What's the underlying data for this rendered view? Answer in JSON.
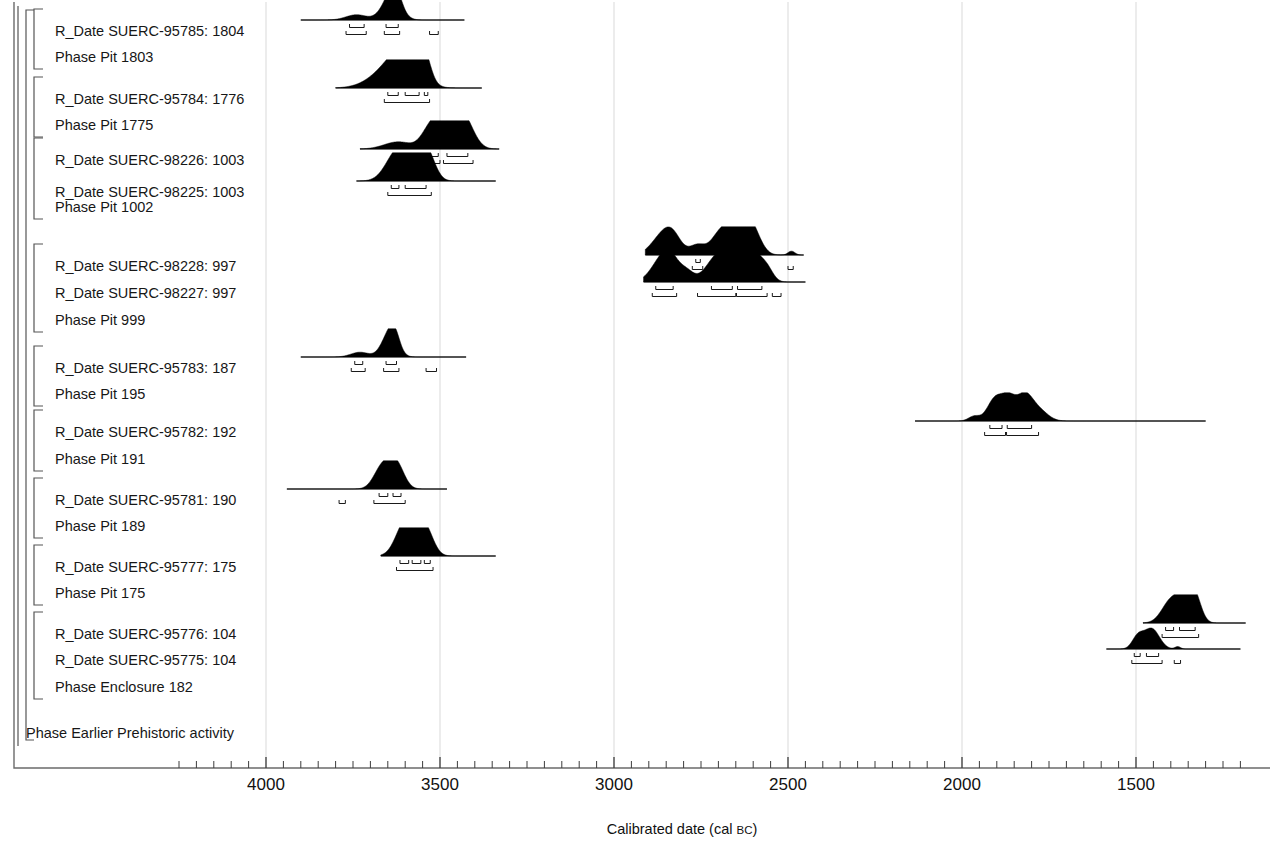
{
  "chart_data": {
    "type": "area",
    "title": "",
    "xlabel": "Calibrated date (cal BC)",
    "xlabel_main": "Calibrated date (cal ",
    "xlabel_smallcaps": "BC",
    "xlabel_tail": ")",
    "grid": true,
    "legend": "none",
    "x_axis": {
      "direction": "reversed",
      "ticks_major": [
        4000,
        3500,
        3000,
        2500,
        2000,
        1500
      ],
      "tick_labels": [
        "4000",
        "3500",
        "3000",
        "2500",
        "2000",
        "1500"
      ],
      "minor_tick_interval": 50,
      "xlim": [
        4290,
        1180
      ]
    },
    "rows": [
      {
        "label": "R_Date SUERC-95785: 1804",
        "kind": "r_date",
        "span": [
          3900,
          3430
        ],
        "peaks": [
          {
            "center": 3740,
            "width": 30,
            "height": 0.22
          },
          {
            "center": 3640,
            "width": 26,
            "height": 1.0
          },
          {
            "center": 3628,
            "width": 16,
            "height": 0.55
          }
        ],
        "ranges_68": [
          [
            3760,
            3718
          ],
          [
            3655,
            3620
          ]
        ],
        "ranges_95": [
          [
            3770,
            3712
          ],
          [
            3660,
            3616
          ],
          [
            3530,
            3505
          ]
        ]
      },
      {
        "label": "Phase Pit 1803",
        "kind": "phase"
      },
      {
        "label": "R_Date SUERC-95784: 1776",
        "kind": "r_date",
        "span": [
          3800,
          3380
        ],
        "peaks": [
          {
            "center": 3640,
            "width": 55,
            "height": 0.82
          },
          {
            "center": 3600,
            "width": 40,
            "height": 0.95
          },
          {
            "center": 3570,
            "width": 26,
            "height": 0.7
          },
          {
            "center": 3545,
            "width": 18,
            "height": 0.78
          }
        ],
        "ranges_68": [
          [
            3650,
            3620
          ],
          [
            3600,
            3560
          ],
          [
            3545,
            3535
          ]
        ],
        "ranges_95": [
          [
            3660,
            3530
          ]
        ]
      },
      {
        "label": "Phase Pit 1775",
        "kind": "phase"
      },
      {
        "label": "R_Date SUERC-98226: 1003",
        "kind": "r_date",
        "span": [
          3730,
          3330
        ],
        "peaks": [
          {
            "center": 3620,
            "width": 40,
            "height": 0.3
          },
          {
            "center": 3530,
            "width": 24,
            "height": 0.78
          },
          {
            "center": 3505,
            "width": 18,
            "height": 0.45
          },
          {
            "center": 3465,
            "width": 34,
            "height": 1.0
          },
          {
            "center": 3430,
            "width": 28,
            "height": 0.92
          }
        ],
        "ranges_68": [
          [
            3630,
            3600
          ],
          [
            3540,
            3505
          ],
          [
            3480,
            3420
          ]
        ],
        "ranges_95": [
          [
            3640,
            3595
          ],
          [
            3545,
            3500
          ],
          [
            3490,
            3405
          ]
        ]
      },
      {
        "label": "R_Date SUERC-98225: 1003",
        "kind": "r_date",
        "span": [
          3740,
          3340
        ],
        "peaks": [
          {
            "center": 3630,
            "width": 30,
            "height": 0.62
          },
          {
            "center": 3600,
            "width": 38,
            "height": 0.85
          },
          {
            "center": 3565,
            "width": 30,
            "height": 0.7
          },
          {
            "center": 3535,
            "width": 22,
            "height": 0.8
          }
        ],
        "ranges_68": [
          [
            3640,
            3618
          ],
          [
            3600,
            3540
          ]
        ],
        "ranges_95": [
          [
            3650,
            3525
          ]
        ]
      },
      {
        "label": "Phase Pit 1002",
        "kind": "phase"
      },
      {
        "label": "R_Date SUERC-98228: 997",
        "kind": "r_date",
        "span": [
          2910,
          2455
        ],
        "peaks": [
          {
            "center": 2860,
            "width": 32,
            "height": 0.8
          },
          {
            "center": 2830,
            "width": 24,
            "height": 0.55
          },
          {
            "center": 2760,
            "width": 22,
            "height": 0.42
          },
          {
            "center": 2700,
            "width": 24,
            "height": 0.72
          },
          {
            "center": 2660,
            "width": 26,
            "height": 0.95
          },
          {
            "center": 2630,
            "width": 24,
            "height": 1.0
          },
          {
            "center": 2600,
            "width": 24,
            "height": 0.85
          },
          {
            "center": 2490,
            "width": 10,
            "height": 0.16
          }
        ],
        "ranges_68": [
          [
            2875,
            2840
          ],
          [
            2765,
            2752
          ],
          [
            2700,
            2585
          ]
        ],
        "ranges_95": [
          [
            2885,
            2830
          ],
          [
            2775,
            2745
          ],
          [
            2710,
            2575
          ],
          [
            2500,
            2485
          ]
        ]
      },
      {
        "label": "R_Date SUERC-98227: 997",
        "kind": "r_date",
        "span": [
          2915,
          2450
        ],
        "peaks": [
          {
            "center": 2865,
            "width": 30,
            "height": 0.85
          },
          {
            "center": 2835,
            "width": 24,
            "height": 0.72
          },
          {
            "center": 2790,
            "width": 20,
            "height": 0.4
          },
          {
            "center": 2710,
            "width": 30,
            "height": 0.88
          },
          {
            "center": 2670,
            "width": 26,
            "height": 0.78
          },
          {
            "center": 2630,
            "width": 28,
            "height": 1.0
          },
          {
            "center": 2595,
            "width": 24,
            "height": 0.8
          },
          {
            "center": 2560,
            "width": 18,
            "height": 0.46
          }
        ],
        "ranges_68": [
          [
            2880,
            2830
          ],
          [
            2720,
            2660
          ],
          [
            2645,
            2575
          ]
        ],
        "ranges_95": [
          [
            2890,
            2820
          ],
          [
            2760,
            2650
          ],
          [
            2648,
            2560
          ],
          [
            2545,
            2520
          ]
        ]
      },
      {
        "label": "Phase Pit 999",
        "kind": "phase"
      },
      {
        "label": "R_Date SUERC-95783: 187",
        "kind": "r_date",
        "span": [
          3900,
          3425
        ],
        "peaks": [
          {
            "center": 3730,
            "width": 26,
            "height": 0.2
          },
          {
            "center": 3645,
            "width": 22,
            "height": 1.0
          },
          {
            "center": 3630,
            "width": 14,
            "height": 0.48
          }
        ],
        "ranges_68": [
          [
            3745,
            3722
          ],
          [
            3655,
            3625
          ]
        ],
        "ranges_95": [
          [
            3755,
            3715
          ],
          [
            3662,
            3618
          ],
          [
            3540,
            3510
          ]
        ]
      },
      {
        "label": "Phase Pit 195",
        "kind": "phase"
      },
      {
        "label": "R_Date SUERC-95782: 192",
        "kind": "r_date",
        "span": [
          2135,
          1300
        ],
        "peaks": [
          {
            "center": 1965,
            "width": 16,
            "height": 0.2
          },
          {
            "center": 1905,
            "width": 22,
            "height": 0.92
          },
          {
            "center": 1865,
            "width": 20,
            "height": 0.88
          },
          {
            "center": 1820,
            "width": 22,
            "height": 1.0
          },
          {
            "center": 1780,
            "width": 26,
            "height": 0.45
          }
        ],
        "ranges_68": [
          [
            1920,
            1885
          ],
          [
            1870,
            1800
          ]
        ],
        "ranges_95": [
          [
            1935,
            1875
          ],
          [
            1872,
            1780
          ]
        ]
      },
      {
        "label": "Phase Pit 191",
        "kind": "phase"
      },
      {
        "label": "R_Date SUERC-95781: 190",
        "kind": "r_date",
        "span": [
          3940,
          3480
        ],
        "peaks": [
          {
            "center": 3665,
            "width": 24,
            "height": 0.95
          },
          {
            "center": 3625,
            "width": 22,
            "height": 1.0
          }
        ],
        "ranges_68": [
          [
            3675,
            3650
          ],
          [
            3635,
            3612
          ]
        ],
        "ranges_95": [
          [
            3790,
            3772
          ],
          [
            3690,
            3600
          ]
        ]
      },
      {
        "label": "Phase Pit 189",
        "kind": "phase"
      },
      {
        "label": "R_Date SUERC-95777: 175",
        "kind": "r_date",
        "span": [
          3670,
          3340
        ],
        "peaks": [
          {
            "center": 3605,
            "width": 26,
            "height": 0.88
          },
          {
            "center": 3575,
            "width": 30,
            "height": 1.0
          },
          {
            "center": 3540,
            "width": 22,
            "height": 0.82
          }
        ],
        "ranges_68": [
          [
            3615,
            3590
          ],
          [
            3580,
            3555
          ],
          [
            3545,
            3528
          ]
        ],
        "ranges_95": [
          [
            3625,
            3520
          ]
        ]
      },
      {
        "label": "Phase Pit 175",
        "kind": "phase"
      },
      {
        "label": "R_Date SUERC-95776: 104",
        "kind": "r_date",
        "span": [
          1480,
          1185
        ],
        "peaks": [
          {
            "center": 1400,
            "width": 26,
            "height": 0.9
          },
          {
            "center": 1355,
            "width": 24,
            "height": 1.0
          },
          {
            "center": 1330,
            "width": 18,
            "height": 0.8
          }
        ],
        "ranges_68": [
          [
            1415,
            1392
          ],
          [
            1375,
            1330
          ]
        ],
        "ranges_95": [
          [
            1425,
            1320
          ]
        ]
      },
      {
        "label": "R_Date SUERC-95775: 104",
        "kind": "r_date",
        "span": [
          1585,
          1200
        ],
        "peaks": [
          {
            "center": 1495,
            "width": 16,
            "height": 0.5
          },
          {
            "center": 1455,
            "width": 22,
            "height": 0.85
          },
          {
            "center": 1380,
            "width": 8,
            "height": 0.1
          }
        ],
        "ranges_68": [
          [
            1505,
            1488
          ],
          [
            1470,
            1435
          ]
        ],
        "ranges_95": [
          [
            1512,
            1425
          ],
          [
            1390,
            1372
          ]
        ]
      },
      {
        "label": "Phase Enclosure 182",
        "kind": "phase"
      },
      {
        "label": "Phase Earlier Prehistoric activity",
        "kind": "phase_outer"
      }
    ]
  },
  "colors": {
    "distribution_fill": "#000000",
    "axis": "#4a4a4a",
    "gridline": "#d9d9d9",
    "bracket": "#555555",
    "text": "#171717"
  }
}
